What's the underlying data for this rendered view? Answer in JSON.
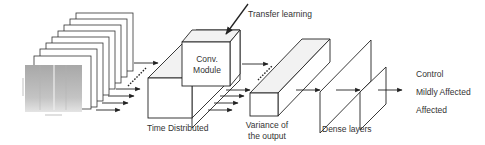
{
  "labels": {
    "transfer_learning": "Transfer learning",
    "conv_module_line1": "Conv.",
    "conv_module_line2": "Module",
    "time_distributed": "Time Distributed",
    "variance_line1": "Variance of",
    "variance_line2": "the output",
    "dense_layers": "Dense layers"
  },
  "outputs": [
    {
      "label": "Control"
    },
    {
      "label": "Mildly Affected"
    },
    {
      "label": "Affected"
    }
  ],
  "colors": {
    "stroke": "#222222",
    "face": "#ffffff",
    "top_face": "#f2f2f2",
    "spectrogram": "#bdbdbd"
  }
}
